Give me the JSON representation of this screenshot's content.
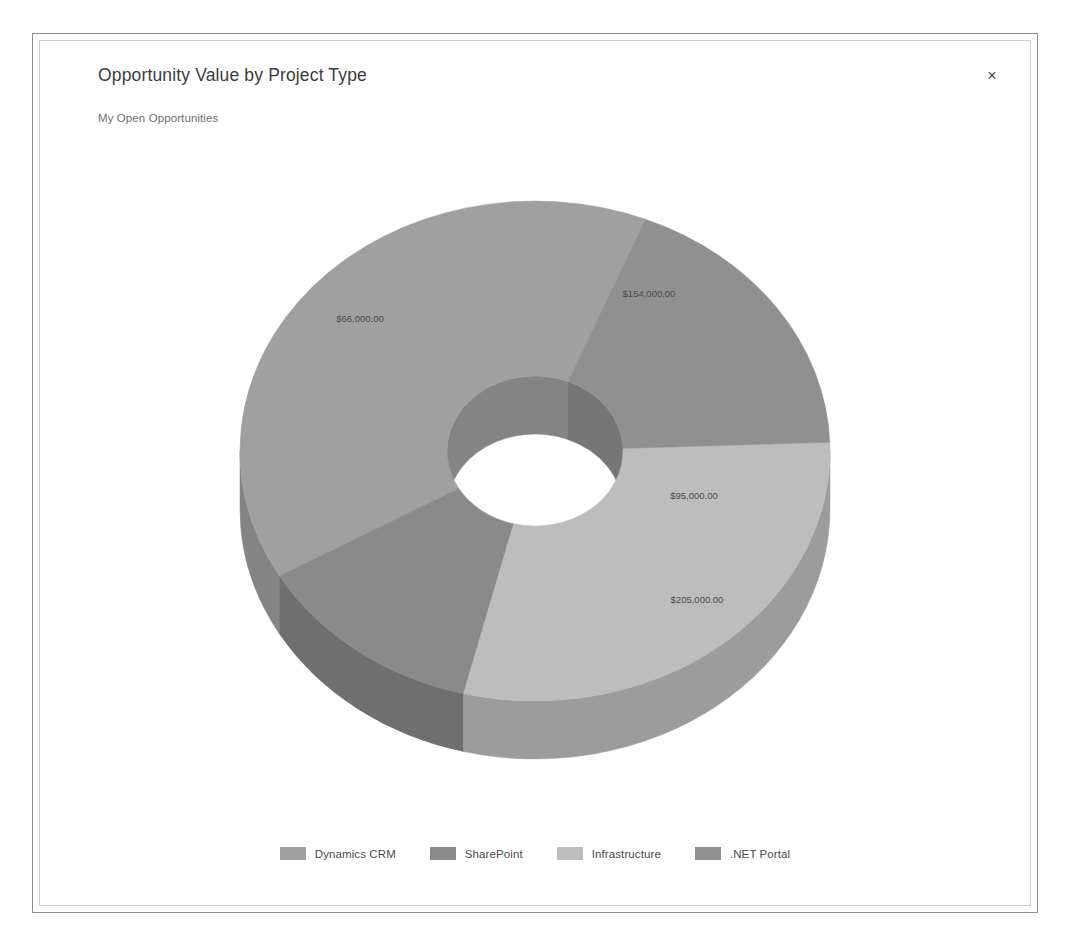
{
  "dialog": {
    "title": "Opportunity Value by Project Type",
    "subtitle": "My Open Opportunities",
    "close_label": "×"
  },
  "chart_data": {
    "type": "pie",
    "variant": "doughnut-3d",
    "title": "Opportunity Value by Project Type",
    "subtitle": "My Open Opportunities",
    "xlabel": "",
    "ylabel": "",
    "legend_position": "bottom",
    "grid": false,
    "value_prefix": "$",
    "categories": [
      "Dynamics CRM",
      "SharePoint",
      "Infrastructure",
      ".NET Portal"
    ],
    "values": [
      205000,
      66000,
      154000,
      95000
    ],
    "labels": [
      "$205,000.00",
      "$66,000.00",
      "$154,000.00",
      "$95,000.00"
    ],
    "colors": [
      "#a0a0a0",
      "#8a8a8a",
      "#bdbdbd",
      "#909090"
    ],
    "side_colors": [
      "#848484",
      "#6f6f6f",
      "#9c9c9c",
      "#767676"
    ],
    "total": 520000,
    "slices": [
      {
        "name": "Dynamics CRM",
        "value": 205000,
        "label": "$205,000.00",
        "percent": 39.4,
        "color": "#a0a0a0",
        "side_color": "#848484",
        "start_angle": 150,
        "end_angle": 292,
        "label_x": 472,
        "label_y": 437
      },
      {
        "name": "SharePoint",
        "value": 66000,
        "label": "$66,000.00",
        "percent": 12.7,
        "color": "#8a8a8a",
        "side_color": "#6f6f6f",
        "start_angle": 104,
        "end_angle": 150,
        "label_x": 135,
        "label_y": 156
      },
      {
        "name": "Infrastructure",
        "value": 154000,
        "label": "$154,000.00",
        "percent": 29.6,
        "color": "#bdbdbd",
        "side_color": "#9c9c9c",
        "start_angle": 358,
        "end_angle": 104,
        "label_x": 424,
        "label_y": 131
      },
      {
        "name": ".NET Portal",
        "value": 95000,
        "label": "$95,000.00",
        "percent": 18.3,
        "color": "#909090",
        "side_color": "#767676",
        "start_angle": 292,
        "end_angle": 358,
        "label_x": 469,
        "label_y": 333
      }
    ]
  },
  "legend": {
    "items": [
      {
        "label": "Dynamics CRM",
        "color": "#a0a0a0"
      },
      {
        "label": "SharePoint",
        "color": "#8a8a8a"
      },
      {
        "label": "Infrastructure",
        "color": "#bdbdbd"
      },
      {
        "label": ".NET Portal",
        "color": "#909090"
      }
    ]
  }
}
